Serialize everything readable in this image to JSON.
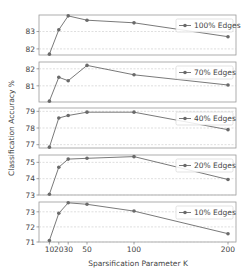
{
  "chart_data": {
    "type": "line",
    "title": "",
    "xlabel": "Sparsification Parameter K",
    "ylabel": "Classification Accuracy %",
    "x": [
      10,
      20,
      30,
      50,
      100,
      200
    ],
    "x_tick_labels": [
      "10",
      "20",
      "30",
      "50",
      "100",
      "200"
    ],
    "grid": true,
    "legend_position": "upper right",
    "line_color": "#6a6a6a",
    "panels": [
      {
        "name": "100% Edges",
        "values": [
          81.7,
          83.1,
          83.9,
          83.65,
          83.5,
          82.7
        ],
        "ylim": [
          81.65,
          83.95
        ],
        "yticks": [
          82,
          83
        ]
      },
      {
        "name": "70% Edges",
        "values": [
          80.1,
          81.5,
          81.3,
          82.2,
          81.65,
          81.05
        ],
        "ylim": [
          80.05,
          82.4
        ],
        "yticks": [
          81,
          82
        ]
      },
      {
        "name": "40% Edges",
        "values": [
          76.85,
          78.6,
          78.75,
          78.95,
          78.95,
          77.9
        ],
        "ylim": [
          76.8,
          79.2
        ],
        "yticks": [
          77,
          78,
          79
        ]
      },
      {
        "name": "20% Edges",
        "values": [
          73.05,
          74.7,
          75.2,
          75.25,
          75.35,
          73.95
        ],
        "ylim": [
          73.0,
          75.45
        ],
        "yticks": [
          73,
          74,
          75
        ]
      },
      {
        "name": "10% Edges",
        "values": [
          71.1,
          72.9,
          73.6,
          73.5,
          73.05,
          71.55
        ],
        "ylim": [
          71.0,
          73.65
        ],
        "yticks": [
          71,
          72,
          73
        ]
      }
    ]
  }
}
